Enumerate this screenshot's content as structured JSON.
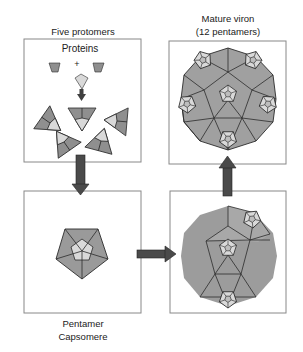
{
  "colors": {
    "dark": "#8a8a8a",
    "mid": "#a3a3a3",
    "light": "#d9d9d9",
    "stroke": "#2b2b2b",
    "arrow": "#4a4a4a",
    "box": "#888888"
  },
  "panels": {
    "protomers": {
      "label": "Five protomers",
      "proteins_label": "Proteins",
      "plus": "+"
    },
    "pentamer": {
      "label_line1": "Pentamer",
      "label_line2": "Capsomere"
    },
    "intermediate": {
      "label": ""
    },
    "mature": {
      "label_line1": "Mature viron",
      "label_line2": "(12 pentamers)"
    }
  },
  "arrows": [
    {
      "from": "protomers",
      "to": "pentamer",
      "direction": "down"
    },
    {
      "from": "pentamer",
      "to": "intermediate",
      "direction": "right"
    },
    {
      "from": "intermediate",
      "to": "mature",
      "direction": "up"
    }
  ]
}
